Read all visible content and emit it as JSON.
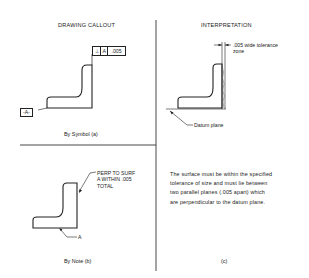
{
  "panels": {
    "drawing_callout": {
      "title": "DRAWING CALLOUT",
      "symbol_caption": "By Symbol (a)",
      "note_caption": "By Note (b)",
      "feature_control_frame": {
        "symbol": "⊥",
        "symbol_name": "perpendicularity",
        "datum": "A",
        "tolerance": ".005"
      },
      "datum_label": "-A-",
      "note_text": [
        "PERP TO SURF",
        "A WITHIN .005",
        "TOTAL"
      ],
      "note_datum_label": "A"
    },
    "interpretation": {
      "title": "INTERPRETATION",
      "zone_label": [
        ".005 wide tolerance",
        "zone"
      ],
      "datum_plane_label": "Datum plane",
      "description": [
        "The surface must be within the specified",
        "tolerance of size and must lie between",
        "two parallel  planes (.005 apart) which",
        "are perpendicular to the datum plane."
      ],
      "caption": "(c)"
    }
  },
  "colors": {
    "line": "#222222",
    "background": "#ffffff"
  }
}
